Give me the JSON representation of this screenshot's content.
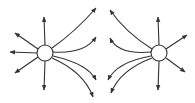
{
  "diagram": {
    "type": "electric-field-lines",
    "stroke_color": "#333333",
    "fill_color": "#ffffff",
    "charges": [
      {
        "id": "left-charge",
        "cx": 45,
        "cy": 53,
        "r": 8,
        "lines": [
          {
            "d": "M45,45 L44,17",
            "dir": "up"
          },
          {
            "d": "M38,49 L15,33",
            "dir": "up-left"
          },
          {
            "d": "M37,53 L10,52",
            "dir": "left"
          },
          {
            "d": "M38,57 L15,73",
            "dir": "down-left"
          },
          {
            "d": "M45,61 L44,90",
            "dir": "down"
          },
          {
            "d": "M52,48 Q75,32 96,8",
            "dir": "right-up-far"
          },
          {
            "d": "M53,52 Q85,54 96,37",
            "dir": "right-up-near"
          },
          {
            "d": "M53,56 Q88,64 96,80",
            "dir": "right-down-near"
          },
          {
            "d": "M52,58 Q84,72 93,97",
            "dir": "right-down-far"
          }
        ]
      },
      {
        "id": "right-charge",
        "cx": 159,
        "cy": 53,
        "r": 8,
        "lines": [
          {
            "d": "M159,45 L158,17",
            "dir": "up"
          },
          {
            "d": "M166,49 L187,35",
            "dir": "up-right"
          },
          {
            "d": "M166,58 L185,72",
            "dir": "down-right"
          },
          {
            "d": "M159,61 L158,90",
            "dir": "down"
          },
          {
            "d": "M152,49 Q125,32 110,10",
            "dir": "left-up-far"
          },
          {
            "d": "M151,52 Q118,55 110,38",
            "dir": "left-up-near"
          },
          {
            "d": "M151,56 Q117,62 108,80",
            "dir": "left-down-near"
          },
          {
            "d": "M152,58 Q120,70 111,93",
            "dir": "left-down-far"
          }
        ]
      }
    ]
  }
}
